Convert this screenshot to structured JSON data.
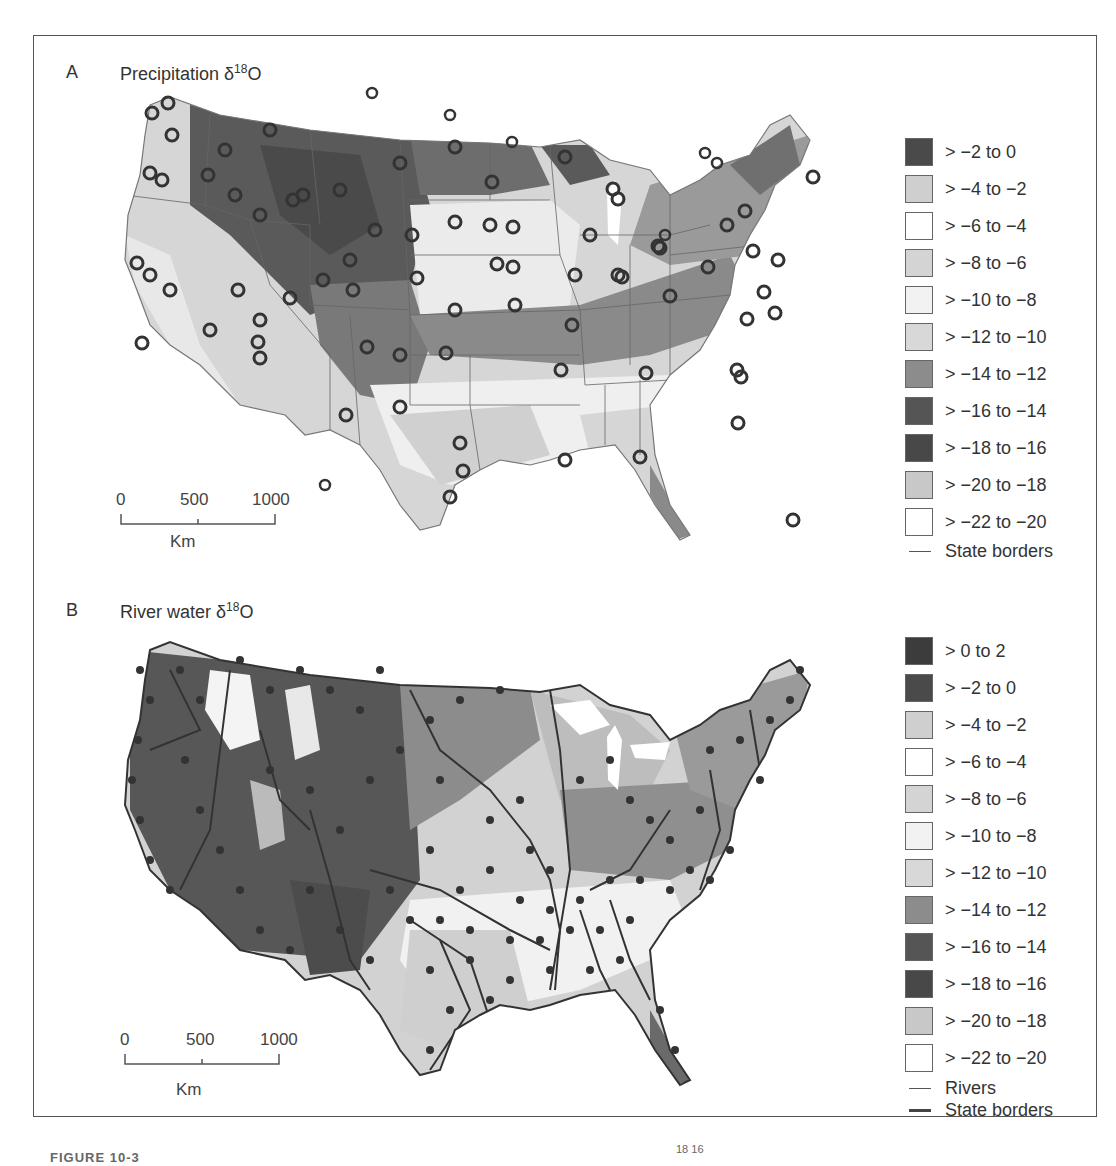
{
  "figure": {
    "caption_fragment": "FIGURE 10-3",
    "caption_superscript_fragment": "18  16"
  },
  "panels": [
    {
      "letter": "A",
      "title_prefix": "Precipitation δ",
      "title_sup": "18",
      "title_suffix": "O",
      "site_marker": "open-circle",
      "scalebar": {
        "ticks": [
          "0",
          "500",
          "1000"
        ],
        "unit": "Km"
      },
      "legend": [
        {
          "label": "> −2 to 0",
          "color": "#4a4a4a"
        },
        {
          "label": "> −4 to −2",
          "color": "#cfcfcf"
        },
        {
          "label": "> −6 to −4",
          "color": "#ffffff"
        },
        {
          "label": "> −8 to −6",
          "color": "#d4d4d4"
        },
        {
          "label": "> −10 to −8",
          "color": "#f2f2f2"
        },
        {
          "label": "> −12 to −10",
          "color": "#d8d8d8"
        },
        {
          "label": "> −14 to −12",
          "color": "#8c8c8c"
        },
        {
          "label": "> −16 to −14",
          "color": "#555555"
        },
        {
          "label": "> −18 to −16",
          "color": "#484848"
        },
        {
          "label": "> −20 to −18",
          "color": "#c8c8c8"
        },
        {
          "label": "> −22 to −20",
          "color": "#ffffff"
        }
      ],
      "line_legend": [
        {
          "label": "State borders",
          "style": "thin"
        }
      ]
    },
    {
      "letter": "B",
      "title_prefix": "River water δ",
      "title_sup": "18",
      "title_suffix": "O",
      "site_marker": "filled-dot",
      "scalebar": {
        "ticks": [
          "0",
          "500",
          "1000"
        ],
        "unit": "Km"
      },
      "legend": [
        {
          "label": "> 0 to 2",
          "color": "#3c3c3c"
        },
        {
          "label": "> −2 to 0",
          "color": "#4a4a4a"
        },
        {
          "label": "> −4 to −2",
          "color": "#cfcfcf"
        },
        {
          "label": "> −6 to −4",
          "color": "#ffffff"
        },
        {
          "label": "> −8 to −6",
          "color": "#d4d4d4"
        },
        {
          "label": "> −10 to −8",
          "color": "#f2f2f2"
        },
        {
          "label": "> −12 to −10",
          "color": "#d8d8d8"
        },
        {
          "label": "> −14 to −12",
          "color": "#8c8c8c"
        },
        {
          "label": "> −16 to −14",
          "color": "#555555"
        },
        {
          "label": "> −18 to −16",
          "color": "#484848"
        },
        {
          "label": "> −20 to −18",
          "color": "#c8c8c8"
        },
        {
          "label": "> −22 to −20",
          "color": "#ffffff"
        }
      ],
      "line_legend": [
        {
          "label": "Rivers",
          "style": "thin"
        },
        {
          "label": "State borders",
          "style": "thick"
        }
      ]
    }
  ]
}
